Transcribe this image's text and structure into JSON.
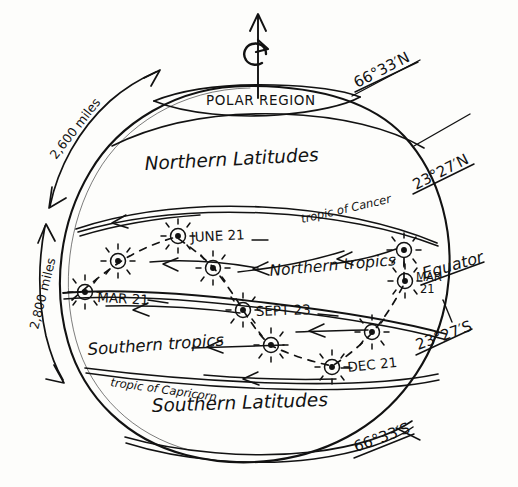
{
  "diagram": {
    "style": "hand-drawn ink sketch on white paper",
    "ink_color": "#121212",
    "paper_color": "#fdfdfb"
  },
  "axis": {
    "name": "rotation-axis",
    "arrow_label": "",
    "rotation_indicator": "counterclockwise-curved-arrow"
  },
  "zones": [
    {
      "id": "polar-region",
      "label": "POLAR REGION",
      "case": "upper"
    },
    {
      "id": "northern-latitudes",
      "label": "Northern Latitudes",
      "case": "title"
    },
    {
      "id": "northern-tropics",
      "label": "Northern tropics",
      "case": "title"
    },
    {
      "id": "southern-tropics",
      "label": "Southern tropics",
      "case": "title"
    },
    {
      "id": "southern-latitudes",
      "label": "Southern Latitudes",
      "case": "title"
    }
  ],
  "latitude_lines": [
    {
      "id": "arctic-circle",
      "label": "66°33′N",
      "underlined": true,
      "side": "right-top"
    },
    {
      "id": "tropic-of-cancer",
      "label": "23°27′N",
      "underlined": true,
      "side": "right-upper"
    },
    {
      "id": "equator",
      "label": "Equator",
      "underlined": true,
      "side": "right-middle"
    },
    {
      "id": "tropic-of-capricorn",
      "label": "23°27′S",
      "underlined": true,
      "side": "right-lower"
    },
    {
      "id": "antarctic-circle",
      "label": "66°33′S",
      "underlined": true,
      "side": "right-bottom"
    }
  ],
  "inline_line_labels": [
    {
      "id": "tropic-of-cancer-inline",
      "label": "tropic of Cancer"
    },
    {
      "id": "tropic-of-capricorn-inline",
      "label": "tropic of Capricorn"
    }
  ],
  "distance_arrows": [
    {
      "id": "polar-to-cancer-distance",
      "label": "2,600 miles",
      "double_headed": true
    },
    {
      "id": "cancer-to-equator-distance",
      "label": "2,800 miles",
      "double_headed": true
    }
  ],
  "sun_events": [
    {
      "id": "june-21",
      "label": "JUNE 21",
      "line": "tropic-of-cancer",
      "x": 178,
      "y": 236
    },
    {
      "id": "sept-23",
      "label": "SEPT 23",
      "line": "equator",
      "x": 243,
      "y": 310
    },
    {
      "id": "mar-21",
      "label": "MAR 21",
      "line": "equator",
      "x": 85,
      "y": 292
    },
    {
      "id": "dec-21",
      "label": "DEC 21",
      "line": "tropic-of-capricorn",
      "x": 332,
      "y": 367
    },
    {
      "id": "mar-21-right",
      "label": "MAR\n21",
      "line": "equator",
      "x": 405,
      "y": 281
    }
  ],
  "sun_markers": [
    {
      "id": "sun-june21",
      "x": 178,
      "y": 236
    },
    {
      "id": "sun-sept23",
      "x": 243,
      "y": 310
    },
    {
      "id": "sun-mar21-left",
      "x": 85,
      "y": 292
    },
    {
      "id": "sun-dec21",
      "x": 332,
      "y": 367
    },
    {
      "id": "sun-mar21-right",
      "x": 405,
      "y": 281
    },
    {
      "id": "sun-mid-north-a",
      "x": 118,
      "y": 261
    },
    {
      "id": "sun-mid-north-b",
      "x": 213,
      "y": 268
    },
    {
      "id": "sun-mid-north-c",
      "x": 404,
      "y": 250
    },
    {
      "id": "sun-mid-south-a",
      "x": 271,
      "y": 345
    },
    {
      "id": "sun-mid-south-b",
      "x": 372,
      "y": 332
    }
  ],
  "annotations": {
    "arrow_direction_note": "arrowheads point westward (leftward) along each latitude band",
    "dashed_path_note": "dashed line traces the sun's apparent annual migration between tropics"
  }
}
